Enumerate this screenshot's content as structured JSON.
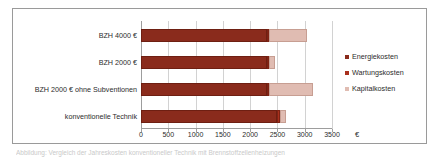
{
  "chart_data": {
    "type": "bar",
    "orientation": "horizontal",
    "stacked": true,
    "title": "",
    "xlabel": "€",
    "ylabel": "",
    "xlim": [
      0,
      3500
    ],
    "xticks": [
      0,
      500,
      1000,
      1500,
      2000,
      2500,
      3000,
      3500
    ],
    "xtick_labels": [
      "0",
      "500",
      "1000",
      "1500",
      "2000",
      "2500",
      "3000",
      "3500"
    ],
    "grid": true,
    "legend_position": "right",
    "categories": [
      "konventionelle Technik",
      "BZH 2000 € ohne Subventionen",
      "BZH 2000 €",
      "BZH 4000 €"
    ],
    "categories_top_to_bottom": [
      "BZH 4000 €",
      "BZH 2000 €",
      "BZH 2000 € ohne Subventionen",
      "konventionelle Technik"
    ],
    "series": [
      {
        "name": "Energiekosten",
        "color": "#8a2b1c",
        "values_top_to_bottom": [
          2300,
          2300,
          2300,
          2500
        ]
      },
      {
        "name": "Wartungskosten",
        "color": "#a9301d",
        "values_top_to_bottom": [
          50,
          50,
          50,
          50
        ]
      },
      {
        "name": "Kapitalkosten",
        "color": "#e0bcb2",
        "values_top_to_bottom": [
          700,
          100,
          800,
          100
        ]
      }
    ],
    "totals_top_to_bottom": [
      3050,
      2450,
      3150,
      2650
    ]
  },
  "legend": {
    "items": [
      {
        "label": "Energiekosten",
        "color": "#8a2b1c"
      },
      {
        "label": "Wartungskosten",
        "color": "#a9301d"
      },
      {
        "label": "Kapitalkosten",
        "color": "#e0bcb2"
      }
    ]
  },
  "axis": {
    "x_title": "€"
  },
  "caption": {
    "text": "Abbildung: Vergleich der Jahreskosten konventioneller Technik mit Brennstoffzellenheizungen"
  },
  "colors": {
    "energie": "#8a2b1c",
    "wartung": "#a9301d",
    "kapital": "#e0bcb2",
    "grid": "#d2d2d2",
    "axis": "#9d9d9d",
    "frame": "#9a9a9a",
    "text": "#2b2b2b",
    "background": "#ffffff"
  }
}
